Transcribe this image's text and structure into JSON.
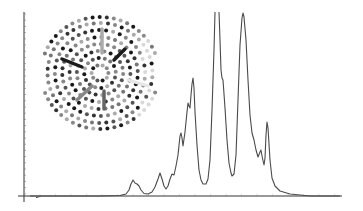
{
  "chart_data": {
    "type": "line",
    "title": "",
    "xlabel": "",
    "ylabel": "",
    "grid": false,
    "legend": null,
    "x_axis_ticks": "unlabeled minor ticks",
    "y_axis_ticks": "unlabeled minor ticks",
    "series": [
      {
        "name": "spectrum",
        "color": "#4a4a4a",
        "points_px": [
          [
            30,
            196
          ],
          [
            100,
            196
          ],
          [
            120,
            195.5
          ],
          [
            126,
            194
          ],
          [
            129,
            190
          ],
          [
            131,
            184
          ],
          [
            133,
            180
          ],
          [
            135,
            183
          ],
          [
            137,
            184
          ],
          [
            139,
            186
          ],
          [
            141,
            190
          ],
          [
            144,
            193.5
          ],
          [
            148,
            194
          ],
          [
            152,
            192
          ],
          [
            155,
            187
          ],
          [
            158,
            179
          ],
          [
            160,
            173
          ],
          [
            162,
            179
          ],
          [
            164,
            186
          ],
          [
            166,
            189
          ],
          [
            168,
            186
          ],
          [
            170,
            179
          ],
          [
            172,
            174
          ],
          [
            174,
            175
          ],
          [
            176,
            166
          ],
          [
            178,
            155
          ],
          [
            180,
            136
          ],
          [
            181,
            133
          ],
          [
            182,
            138
          ],
          [
            183,
            146
          ],
          [
            185,
            132
          ],
          [
            187,
            112
          ],
          [
            188,
            103
          ],
          [
            189,
            106
          ],
          [
            190,
            108
          ],
          [
            191,
            95
          ],
          [
            192,
            84
          ],
          [
            193,
            78
          ],
          [
            194,
            88
          ],
          [
            195,
            112
          ],
          [
            197,
            145
          ],
          [
            199,
            170
          ],
          [
            201,
            180
          ],
          [
            203,
            184
          ],
          [
            206,
            184
          ],
          [
            208,
            179
          ],
          [
            210,
            160
          ],
          [
            212,
            110
          ],
          [
            214,
            50
          ],
          [
            215,
            12
          ],
          [
            219,
            12
          ],
          [
            220,
            40
          ],
          [
            221,
            70
          ],
          [
            222,
            78
          ],
          [
            223,
            80
          ],
          [
            225,
            108
          ],
          [
            227,
            140
          ],
          [
            229,
            163
          ],
          [
            231,
            173
          ],
          [
            232,
            176
          ],
          [
            234,
            174
          ],
          [
            236,
            155
          ],
          [
            238,
            100
          ],
          [
            240,
            45
          ],
          [
            242,
            18
          ],
          [
            243,
            13
          ],
          [
            244,
            17
          ],
          [
            246,
            40
          ],
          [
            248,
            80
          ],
          [
            250,
            115
          ],
          [
            252,
            133
          ],
          [
            254,
            140
          ],
          [
            256,
            150
          ],
          [
            258,
            157
          ],
          [
            260,
            152
          ],
          [
            261,
            150
          ],
          [
            262,
            156
          ],
          [
            264,
            165
          ],
          [
            265,
            158
          ],
          [
            266,
            135
          ],
          [
            267,
            122
          ],
          [
            268,
            128
          ],
          [
            270,
            160
          ],
          [
            272,
            178
          ],
          [
            275,
            186
          ],
          [
            280,
            191
          ],
          [
            290,
            194
          ],
          [
            310,
            196
          ],
          [
            340,
            196
          ]
        ],
        "clipped_peaks_px": [
          [
            215,
            12
          ],
          [
            219,
            12
          ]
        ]
      }
    ],
    "axes": {
      "x_axis": {
        "y_px": 196,
        "x_start_px": 18,
        "x_end_px": 342
      },
      "y_axis": {
        "x_px": 24,
        "y_start_px": 12,
        "y_end_px": 202
      }
    },
    "inset": {
      "type": "quasicrystal-tiling",
      "symmetry": "decagonal",
      "highlighted_bonds": 6
    }
  },
  "figure": {
    "background": "#ffffff",
    "axis_color": "#333333",
    "curve_color": "#4a4a4a"
  }
}
